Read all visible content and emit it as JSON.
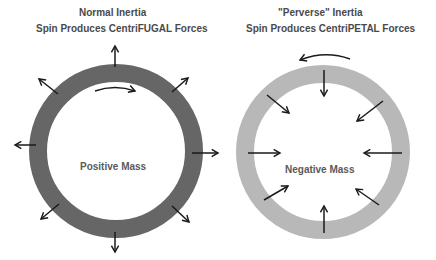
{
  "left_panel": {
    "title_line1": "Normal Inertia",
    "title_line2": "Spin Produces CentriFUGAL Forces",
    "center_label": "Positive Mass",
    "ring_color": "#666666",
    "spin_direction": "clockwise",
    "force_direction": "outward",
    "arrow_count": 8
  },
  "right_panel": {
    "title_line1": "\"Perverse\" Inertia",
    "title_line2": "Spin Produces CentriPETAL Forces",
    "center_label": "Negative Mass",
    "ring_color": "#b8b8b8",
    "spin_direction": "counter-clockwise",
    "force_direction": "inward",
    "arrow_count": 8
  },
  "colors": {
    "arrow": "#1a1a1a",
    "title_text": "#4a4a4a",
    "label_text": "#5a5a5a",
    "background": "#ffffff"
  }
}
